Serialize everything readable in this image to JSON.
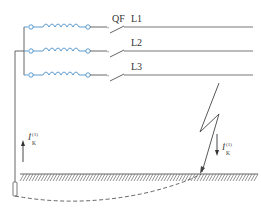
{
  "diagram": {
    "colors": {
      "wire": "#555555",
      "winding": "#4a90c8",
      "ground_hatch": "#555555"
    },
    "breaker_label": "QF",
    "lines": [
      {
        "label": "L1",
        "y": 27
      },
      {
        "label": "L2",
        "y": 51
      },
      {
        "label": "L3",
        "y": 75
      }
    ],
    "current_label_main": "İ",
    "current_label_sub": "K",
    "current_label_sup": "(1)",
    "current_arrows": [
      {
        "name": "return-current",
        "direction": "up"
      },
      {
        "name": "fault-current",
        "direction": "down"
      }
    ],
    "symbols": [
      "generator-winding-icon",
      "circuit-breaker-icon",
      "lightning-fault-icon",
      "earth-ground-icon",
      "ground-electrode-icon"
    ]
  }
}
